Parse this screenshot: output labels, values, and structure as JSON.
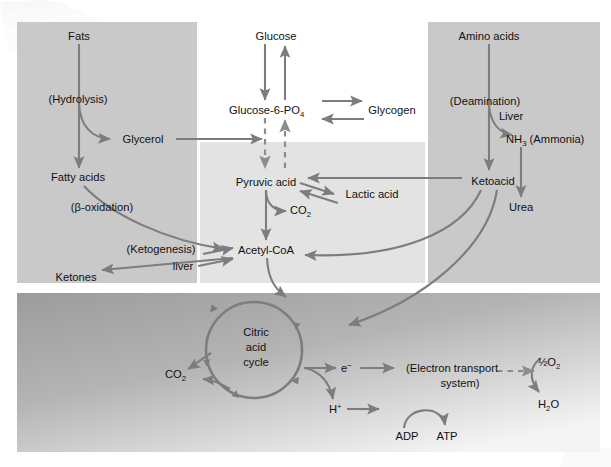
{
  "figure": {
    "type": "metabolic-pathway-diagram"
  },
  "colors": {
    "panel_fats": "#c9c9c9",
    "panel_carbohydrate": "#e3e3e3",
    "panel_protein": "#c9c9c9",
    "panel_mitochondrion_top": "#9e9e9e",
    "panel_mitochondrion_bottom": "#f2f2f2",
    "arrow": "#7d7d7d",
    "text": "#111111",
    "background": "#ffffff"
  },
  "panels": {
    "fats": {
      "name": "fats-panel",
      "x": 17,
      "y": 22,
      "w": 180,
      "h": 261
    },
    "carbohydrate": {
      "name": "carbohydrate-panel",
      "x": 200,
      "y": 142,
      "w": 225,
      "h": 141
    },
    "protein": {
      "name": "protein-panel",
      "x": 428,
      "y": 22,
      "w": 172,
      "h": 261
    },
    "mitochondrion": {
      "name": "mitochondrion-panel",
      "x": 17,
      "y": 293,
      "w": 583,
      "h": 159
    }
  },
  "nodes": {
    "fats": {
      "label": "Fats",
      "x": 79,
      "y": 36
    },
    "hydrolysis": {
      "label": "(Hydrolysis)",
      "x": 78,
      "y": 99
    },
    "glycerol": {
      "label": "Glycerol",
      "x": 143,
      "y": 139
    },
    "fatty_acids": {
      "label": "Fatty acids",
      "x": 78,
      "y": 177
    },
    "beta_oxidation": {
      "label": "(β-oxidation)",
      "x": 102,
      "y": 207
    },
    "ketogenesis": {
      "label": "(Ketogenesis)",
      "x": 161,
      "y": 249
    },
    "liver_keto": {
      "label": "liver",
      "x": 180,
      "y": 266
    },
    "ketones": {
      "label": "Ketones",
      "x": 80,
      "y": 277
    },
    "glucose": {
      "label": "Glucose",
      "x": 276,
      "y": 36
    },
    "glucose_6_po4": {
      "label": "Glucose-6-PO",
      "sub": "4",
      "x": 272,
      "y": 110
    },
    "glycogen": {
      "label": "Glycogen",
      "x": 390,
      "y": 110
    },
    "pyruvic_acid": {
      "label": "Pyruvic acid",
      "x": 267,
      "y": 182
    },
    "lactic_acid": {
      "label": "Lactic acid",
      "x": 359,
      "y": 194
    },
    "co2_pyruvate": {
      "label": "CO",
      "sub": "2",
      "x": 301,
      "y": 210
    },
    "acetyl_coa": {
      "label": "Acetyl-CoA",
      "x": 266,
      "y": 250
    },
    "amino_acids": {
      "label": "Amino acids",
      "x": 489,
      "y": 36
    },
    "deamination": {
      "label": "(Deamination)",
      "x": 485,
      "y": 101
    },
    "liver_deam": {
      "label": "Liver",
      "x": 507,
      "y": 116
    },
    "ammonia": {
      "label": "NH",
      "sub": "3",
      "label2": " (Ammonia)",
      "x": 513,
      "y": 139
    },
    "ketoacid": {
      "label": "Ketoacid",
      "x": 493,
      "y": 181
    },
    "urea": {
      "label": "Urea",
      "x": 521,
      "y": 207
    },
    "citric_acid_cycle": {
      "line1": "Citric",
      "line2": "acid",
      "line3": "cycle",
      "x": 256,
      "y": 332
    },
    "co2_cycle": {
      "label": "CO",
      "sub": "2",
      "x": 176,
      "y": 374
    },
    "electron": {
      "label": "e",
      "sup": "−",
      "x": 348,
      "y": 371
    },
    "electron_transport": {
      "line1": "(Electron transport",
      "line2": "system)",
      "x": 452,
      "y": 371
    },
    "proton": {
      "label": "H",
      "sup": "+",
      "x": 335,
      "y": 410
    },
    "adp": {
      "label": "ADP",
      "x": 407,
      "y": 436
    },
    "atp": {
      "label": "ATP",
      "x": 447,
      "y": 436
    },
    "half_o2": {
      "label": "½O",
      "sub": "2",
      "x": 549,
      "y": 362
    },
    "water": {
      "label": "H",
      "sub": "2",
      "label2": "O",
      "x": 551,
      "y": 404
    }
  },
  "edges": [
    {
      "name": "fats-to-fatty-acids",
      "from": "Fats",
      "to": "Fatty acids",
      "style": "solid"
    },
    {
      "name": "hydrolysis-to-glycerol",
      "from": "Fats",
      "to": "Glycerol",
      "style": "curved"
    },
    {
      "name": "glycerol-to-glycolysis",
      "from": "Glycerol",
      "to": "Glucose-6-PO4 pathway",
      "style": "solid"
    },
    {
      "name": "fatty-acids-to-acetyl-coa",
      "from": "Fatty acids",
      "to": "Acetyl-CoA",
      "style": "curved",
      "note": "β-oxidation"
    },
    {
      "name": "ketogenesis-to-acetyl-coa",
      "from": "Ketones",
      "to": "Acetyl-CoA",
      "style": "solid"
    },
    {
      "name": "acetyl-coa-to-ketones",
      "from": "Acetyl-CoA",
      "to": "Ketones",
      "style": "solid"
    },
    {
      "name": "glucose-to-g6p",
      "from": "Glucose",
      "to": "Glucose-6-PO4",
      "style": "solid"
    },
    {
      "name": "g6p-to-glucose",
      "from": "Glucose-6-PO4",
      "to": "Glucose",
      "style": "solid"
    },
    {
      "name": "g6p-to-glycogen",
      "from": "Glucose-6-PO4",
      "to": "Glycogen",
      "style": "solid"
    },
    {
      "name": "glycogen-to-g6p",
      "from": "Glycogen",
      "to": "Glucose-6-PO4",
      "style": "solid"
    },
    {
      "name": "g6p-to-pyruvic-acid",
      "from": "Glucose-6-PO4",
      "to": "Pyruvic acid",
      "style": "dashed"
    },
    {
      "name": "pyruvic-acid-to-g6p",
      "from": "Pyruvic acid",
      "to": "Glucose-6-PO4",
      "style": "dashed"
    },
    {
      "name": "pyruvic-to-lactic",
      "from": "Pyruvic acid",
      "to": "Lactic acid",
      "style": "solid"
    },
    {
      "name": "lactic-to-pyruvic",
      "from": "Lactic acid",
      "to": "Pyruvic acid",
      "style": "solid"
    },
    {
      "name": "pyruvic-to-co2",
      "from": "Pyruvic acid",
      "to": "CO2",
      "style": "curved"
    },
    {
      "name": "pyruvic-to-acetyl-coa",
      "from": "Pyruvic acid",
      "to": "Acetyl-CoA",
      "style": "solid"
    },
    {
      "name": "amino-acids-to-ketoacid",
      "from": "Amino acids",
      "to": "Ketoacid",
      "style": "solid"
    },
    {
      "name": "deamination-to-ammonia",
      "from": "Amino acids",
      "to": "NH3 (Ammonia)",
      "style": "curved"
    },
    {
      "name": "ammonia-to-urea",
      "from": "NH3 (Ammonia)",
      "to": "Urea",
      "style": "solid"
    },
    {
      "name": "ketoacid-to-pyruvic",
      "from": "Ketoacid",
      "to": "Pyruvic acid",
      "style": "solid"
    },
    {
      "name": "ketoacid-to-acetyl-coa",
      "from": "Ketoacid",
      "to": "Acetyl-CoA",
      "style": "curved"
    },
    {
      "name": "ketoacid-to-citric-cycle",
      "from": "Ketoacid",
      "to": "Citric acid cycle",
      "style": "curved"
    },
    {
      "name": "acetyl-coa-to-cycle",
      "from": "Acetyl-CoA",
      "to": "Citric acid cycle",
      "style": "curved"
    },
    {
      "name": "cycle-to-co2",
      "from": "Citric acid cycle",
      "to": "CO2",
      "style": "curved"
    },
    {
      "name": "cycle-to-electron",
      "from": "Citric acid cycle",
      "to": "e−",
      "style": "solid"
    },
    {
      "name": "cycle-to-proton",
      "from": "Citric acid cycle",
      "to": "H+",
      "style": "curved"
    },
    {
      "name": "electron-to-ets",
      "from": "e−",
      "to": "(Electron transport system)",
      "style": "solid"
    },
    {
      "name": "proton-to-ets",
      "from": "H+",
      "to": "(Electron transport system)",
      "style": "solid"
    },
    {
      "name": "ets-to-water",
      "from": "(Electron transport system)",
      "to": "H2O",
      "style": "dashed"
    },
    {
      "name": "o2-to-water",
      "from": "½O2",
      "to": "H2O",
      "style": "curved"
    },
    {
      "name": "adp-to-atp",
      "from": "ADP",
      "to": "ATP",
      "style": "curved-arc"
    }
  ]
}
